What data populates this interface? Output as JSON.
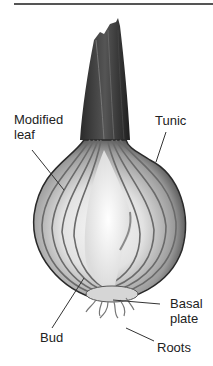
{
  "figure": {
    "labels": {
      "modified_leaf": [
        "Modified",
        "leaf"
      ],
      "tunic": "Tunic",
      "basal_plate": [
        "Basal",
        "plate"
      ],
      "bud": "Bud",
      "roots": "Roots"
    },
    "colors": {
      "line": "#333333",
      "text": "#222222",
      "rule": "#555555"
    }
  }
}
